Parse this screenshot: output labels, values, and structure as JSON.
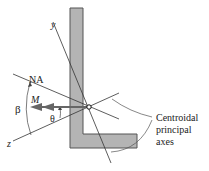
{
  "labels": {
    "y_axis": "y",
    "z_axis": "z",
    "neutral_axis": "NA",
    "moment": "M",
    "beta": "β",
    "theta": "θ",
    "callout_line1": "Centroidal",
    "callout_line2": "principal",
    "callout_line3": "axes"
  },
  "colors": {
    "section_fill": "#b4b4b4",
    "section_stroke": "#555555",
    "line": "#333333",
    "arrow": "#666666"
  }
}
